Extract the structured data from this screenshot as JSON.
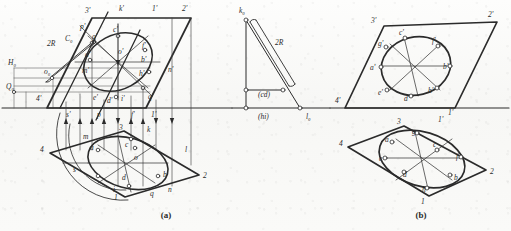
{
  "figure": {
    "background_color": "#fbfbfa",
    "line_color": "#2b2b2b",
    "captions": [
      {
        "id": "cap-a",
        "label": "(a)",
        "x": 166,
        "y": 218
      },
      {
        "id": "cap-b",
        "label": "(b)",
        "x": 421,
        "y": 218
      }
    ]
  },
  "panel_a": {
    "name": "two-view-projection",
    "caption": "(a)",
    "ground_line_y": 108,
    "plane_traces": [
      {
        "label": "2R",
        "x": 47,
        "y": 46
      },
      {
        "label": "H₀",
        "x": 8,
        "y": 65
      },
      {
        "label": "Q₀",
        "x": 6,
        "y": 89
      },
      {
        "label": "C₀",
        "x": 65,
        "y": 41
      },
      {
        "label": "o₀",
        "x": 44,
        "y": 74
      }
    ],
    "front_view": {
      "name": "front-view-parallelogram",
      "corner_labels": [
        {
          "label": "3'",
          "x": 85,
          "y": 13
        },
        {
          "label": "k'",
          "x": 119,
          "y": 11
        },
        {
          "label": "1'",
          "x": 152,
          "y": 11
        },
        {
          "label": "2'",
          "x": 182,
          "y": 11
        },
        {
          "label": "4'",
          "x": 36,
          "y": 101
        }
      ],
      "point_labels": [
        {
          "label": "p'",
          "x": 80,
          "y": 29
        },
        {
          "label": "g'",
          "x": 92,
          "y": 39
        },
        {
          "label": "c'",
          "x": 113,
          "y": 32
        },
        {
          "label": "f'",
          "x": 142,
          "y": 48
        },
        {
          "label": "a'",
          "x": 85,
          "y": 57
        },
        {
          "label": "o'",
          "x": 118,
          "y": 54
        },
        {
          "label": "b'",
          "x": 141,
          "y": 62
        },
        {
          "label": "m'",
          "x": 82,
          "y": 73
        },
        {
          "label": "h'",
          "x": 139,
          "y": 76
        },
        {
          "label": "n'",
          "x": 168,
          "y": 72
        },
        {
          "label": "e'",
          "x": 93,
          "y": 100
        },
        {
          "label": "d'",
          "x": 107,
          "y": 103
        },
        {
          "label": "i'",
          "x": 121,
          "y": 101
        },
        {
          "label": "q'",
          "x": 148,
          "y": 99
        }
      ]
    },
    "top_view": {
      "name": "top-view-parallelogram",
      "corner_labels": [
        {
          "label": "4",
          "x": 40,
          "y": 152
        },
        {
          "label": "3",
          "x": 119,
          "y": 130
        },
        {
          "label": "1'",
          "x": 151,
          "y": 117
        },
        {
          "label": "1",
          "x": 114,
          "y": 200
        },
        {
          "label": "2",
          "x": 203,
          "y": 178
        }
      ],
      "point_labels": [
        {
          "label": "s'",
          "x": 66,
          "y": 117
        },
        {
          "label": "p",
          "x": 97,
          "y": 117
        },
        {
          "label": "f'",
          "x": 131,
          "y": 117
        },
        {
          "label": "m",
          "x": 83,
          "y": 139
        },
        {
          "label": "a",
          "x": 90,
          "y": 150
        },
        {
          "label": "c",
          "x": 125,
          "y": 147
        },
        {
          "label": "o",
          "x": 134,
          "y": 160
        },
        {
          "label": "k",
          "x": 147,
          "y": 132
        },
        {
          "label": "l",
          "x": 185,
          "y": 152
        },
        {
          "label": "s",
          "x": 73,
          "y": 172
        },
        {
          "label": "d",
          "x": 122,
          "y": 180
        },
        {
          "label": "b",
          "x": 163,
          "y": 177
        },
        {
          "label": "n",
          "x": 168,
          "y": 192
        },
        {
          "label": "q",
          "x": 150,
          "y": 196
        },
        {
          "label": "i",
          "x": 113,
          "y": 192
        }
      ]
    }
  },
  "panel_mid": {
    "name": "true-length-triangle",
    "labels": [
      {
        "label": "k₀",
        "x": 239,
        "y": 13
      },
      {
        "label": "2R",
        "x": 275,
        "y": 45
      },
      {
        "label": "(cd)",
        "x": 258,
        "y": 97
      },
      {
        "label": "(hi)",
        "x": 258,
        "y": 119
      },
      {
        "label": "l₀",
        "x": 306,
        "y": 119
      }
    ]
  },
  "panel_b": {
    "name": "resulting-views",
    "caption": "(b)",
    "front_view": {
      "name": "panel-b-front-view",
      "corner_labels": [
        {
          "label": "3'",
          "x": 371,
          "y": 23
        },
        {
          "label": "2'",
          "x": 488,
          "y": 17
        },
        {
          "label": "4'",
          "x": 335,
          "y": 103
        },
        {
          "label": "1'",
          "x": 448,
          "y": 115
        }
      ],
      "point_labels": [
        {
          "label": "c'",
          "x": 399,
          "y": 35
        },
        {
          "label": "g'",
          "x": 378,
          "y": 46
        },
        {
          "label": "f'",
          "x": 432,
          "y": 43
        },
        {
          "label": "a'",
          "x": 370,
          "y": 70
        },
        {
          "label": "b'",
          "x": 443,
          "y": 69
        },
        {
          "label": "e'",
          "x": 378,
          "y": 95
        },
        {
          "label": "d'",
          "x": 404,
          "y": 101
        },
        {
          "label": "h'",
          "x": 428,
          "y": 93
        }
      ]
    },
    "top_view": {
      "name": "panel-b-top-view",
      "corner_labels": [
        {
          "label": "3",
          "x": 397,
          "y": 124
        },
        {
          "label": "1'",
          "x": 438,
          "y": 122
        },
        {
          "label": "4",
          "x": 339,
          "y": 146
        },
        {
          "label": "2",
          "x": 490,
          "y": 174
        },
        {
          "label": "1",
          "x": 421,
          "y": 204
        }
      ],
      "point_labels": [
        {
          "label": "g",
          "x": 412,
          "y": 134
        },
        {
          "label": "a",
          "x": 385,
          "y": 142
        },
        {
          "label": "c",
          "x": 433,
          "y": 147
        },
        {
          "label": "e",
          "x": 379,
          "y": 161
        },
        {
          "label": "f",
          "x": 456,
          "y": 159
        },
        {
          "label": "d",
          "x": 403,
          "y": 177
        },
        {
          "label": "b",
          "x": 454,
          "y": 180
        },
        {
          "label": "h",
          "x": 422,
          "y": 192
        }
      ]
    }
  }
}
